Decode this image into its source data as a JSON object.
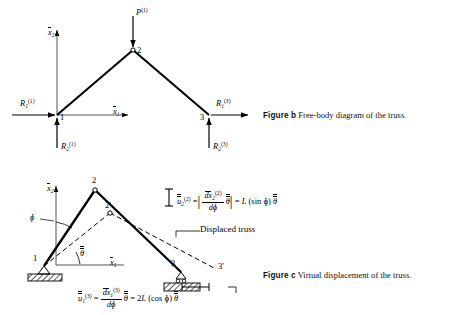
{
  "figure_b": {
    "id": "figure-b",
    "caption_head": "Figure b",
    "caption_text": "Free-body diagram of the truss.",
    "axis_vertical": "x̅2",
    "axis_horizontal": "x̅1",
    "nodes": [
      {
        "id": "1",
        "label": "1"
      },
      {
        "id": "2",
        "label": "2"
      },
      {
        "id": "3",
        "label": "3"
      }
    ],
    "loads": [
      {
        "name": "applied-load",
        "symbol": "P",
        "sub": "",
        "sup": "(1)",
        "at_node": "2",
        "direction": "down"
      }
    ],
    "reactions": [
      {
        "name": "reaction-R1-node1",
        "symbol": "R",
        "sub": "1",
        "sup": "(1)",
        "at_node": "1",
        "direction": "right"
      },
      {
        "name": "reaction-R2-node1",
        "symbol": "R",
        "sub": "2",
        "sup": "(1)",
        "at_node": "1",
        "direction": "up"
      },
      {
        "name": "reaction-R1-node3",
        "symbol": "R",
        "sub": "1",
        "sup": "(3)",
        "at_node": "3",
        "direction": "right"
      },
      {
        "name": "reaction-R2-node3",
        "symbol": "R",
        "sub": "2",
        "sup": "(3)",
        "at_node": "3",
        "direction": "up"
      }
    ]
  },
  "figure_c": {
    "id": "figure-c",
    "caption_head": "Figure c",
    "caption_text": "Virtual displacement of the truss.",
    "axis_vertical": "x̅2",
    "axis_horizontal": "x̅1",
    "nodes": [
      {
        "id": "1",
        "label": "1"
      },
      {
        "id": "2",
        "label": "2"
      },
      {
        "id": "3",
        "label": "3"
      },
      {
        "id": "2p",
        "label": "2'"
      },
      {
        "id": "3p",
        "label": "3'"
      }
    ],
    "angles": [
      {
        "name": "angle-phi",
        "label": "φ"
      },
      {
        "name": "angle-theta-bar",
        "label": "θ"
      }
    ],
    "annotations": [
      {
        "name": "displaced-truss-label",
        "text": "Displaced truss"
      }
    ],
    "equation_vertical": {
      "lhs_symbol": "u",
      "lhs_sub": "2",
      "lhs_sup": "(2)",
      "bar_symbol": "θ",
      "frac_num": "dx̅2",
      "frac_num_sup": "(2)",
      "frac_den": "dφ",
      "rhs": "= L (sin φ)",
      "rhs_theta": "θ",
      "full": "u̅(2)2 = | dx̅(2)2 / dφ θ̅ | = L (sin φ) θ̅"
    },
    "equation_horizontal": {
      "lhs_symbol": "u",
      "lhs_sub": "1",
      "lhs_sup": "(3)",
      "frac_num": "dx̅1",
      "frac_num_sup": "(3)",
      "frac_den": "dφ",
      "mid_theta": "θ",
      "rhs": "= 2L (cos φ)",
      "rhs_theta": "θ",
      "full": "u̅(3)1 = dx̅(3)1 / dφ θ̅ = 2L (cos φ) θ̅"
    }
  },
  "colors": {
    "ink": "#000000",
    "paper": "#ffffff",
    "hatch": "#111111"
  }
}
